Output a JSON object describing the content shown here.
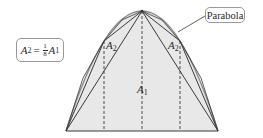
{
  "diagram": {
    "colors": {
      "fill": "#e8e8e8",
      "stroke": "#3a3a3a",
      "parabola": "#8a8a8a",
      "callout_border": "#9a9a9a",
      "text": "#2a2a2a"
    },
    "labels": {
      "A1": {
        "base": "A",
        "sub": "1"
      },
      "A2_left": {
        "base": "A",
        "sub": "2"
      },
      "A2_right": {
        "base": "A",
        "sub": "2"
      }
    },
    "callouts": {
      "parabola": "Parabola",
      "formula": {
        "lhs_base": "A",
        "lhs_sub": "2",
        "equals": "=",
        "frac_num": "1",
        "frac_den": "8",
        "rhs_base": "A",
        "rhs_sub": "1"
      }
    },
    "geometry": {
      "apex": [
        142,
        11
      ],
      "base_left": [
        66,
        131
      ],
      "base_right": [
        218,
        131
      ],
      "left_vertex": [
        104,
        41
      ],
      "right_vertex": [
        180,
        41
      ]
    }
  }
}
